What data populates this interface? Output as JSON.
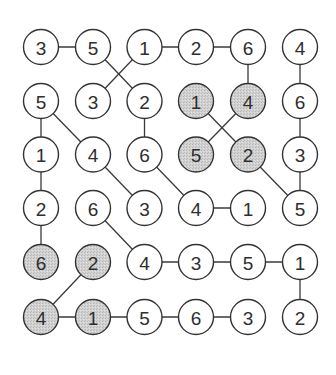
{
  "puzzle": {
    "type": "number-grid-connection-puzzle",
    "rows": 6,
    "cols": 6,
    "grid": [
      [
        3,
        5,
        1,
        2,
        6,
        4
      ],
      [
        5,
        3,
        2,
        1,
        4,
        6
      ],
      [
        1,
        4,
        6,
        5,
        2,
        3
      ],
      [
        2,
        6,
        3,
        4,
        1,
        5
      ],
      [
        6,
        2,
        4,
        3,
        5,
        1
      ],
      [
        4,
        1,
        5,
        6,
        3,
        2
      ]
    ],
    "shaded": [
      [
        1,
        3
      ],
      [
        1,
        4
      ],
      [
        2,
        3
      ],
      [
        2,
        4
      ],
      [
        4,
        0
      ],
      [
        4,
        1
      ],
      [
        5,
        0
      ],
      [
        5,
        1
      ]
    ],
    "edges": [
      [
        [
          0,
          0
        ],
        [
          0,
          1
        ]
      ],
      [
        [
          0,
          1
        ],
        [
          1,
          2
        ]
      ],
      [
        [
          0,
          2
        ],
        [
          1,
          1
        ]
      ],
      [
        [
          0,
          2
        ],
        [
          0,
          3
        ]
      ],
      [
        [
          0,
          3
        ],
        [
          0,
          4
        ]
      ],
      [
        [
          0,
          4
        ],
        [
          1,
          4
        ]
      ],
      [
        [
          0,
          5
        ],
        [
          1,
          5
        ]
      ],
      [
        [
          1,
          0
        ],
        [
          2,
          0
        ]
      ],
      [
        [
          1,
          0
        ],
        [
          2,
          1
        ]
      ],
      [
        [
          1,
          2
        ],
        [
          2,
          2
        ]
      ],
      [
        [
          1,
          3
        ],
        [
          2,
          4
        ]
      ],
      [
        [
          1,
          4
        ],
        [
          2,
          3
        ]
      ],
      [
        [
          1,
          5
        ],
        [
          2,
          5
        ]
      ],
      [
        [
          2,
          0
        ],
        [
          3,
          0
        ]
      ],
      [
        [
          2,
          1
        ],
        [
          3,
          2
        ]
      ],
      [
        [
          2,
          2
        ],
        [
          3,
          3
        ]
      ],
      [
        [
          2,
          4
        ],
        [
          3,
          5
        ]
      ],
      [
        [
          2,
          5
        ],
        [
          3,
          5
        ]
      ],
      [
        [
          3,
          0
        ],
        [
          4,
          0
        ]
      ],
      [
        [
          3,
          1
        ],
        [
          4,
          2
        ]
      ],
      [
        [
          3,
          3
        ],
        [
          3,
          4
        ]
      ],
      [
        [
          4,
          1
        ],
        [
          5,
          0
        ]
      ],
      [
        [
          4,
          2
        ],
        [
          4,
          3
        ]
      ],
      [
        [
          4,
          3
        ],
        [
          4,
          4
        ]
      ],
      [
        [
          4,
          4
        ],
        [
          4,
          5
        ]
      ],
      [
        [
          4,
          5
        ],
        [
          5,
          5
        ]
      ],
      [
        [
          5,
          0
        ],
        [
          5,
          1
        ]
      ],
      [
        [
          5,
          1
        ],
        [
          5,
          2
        ]
      ],
      [
        [
          5,
          2
        ],
        [
          5,
          3
        ]
      ],
      [
        [
          5,
          3
        ],
        [
          5,
          4
        ]
      ]
    ],
    "colors": {
      "background": "#ffffff",
      "circle_fill": "#ffffff",
      "shaded_fill": "#cfcfcf",
      "stroke": "#333333",
      "text": "#2e2e2e"
    }
  }
}
